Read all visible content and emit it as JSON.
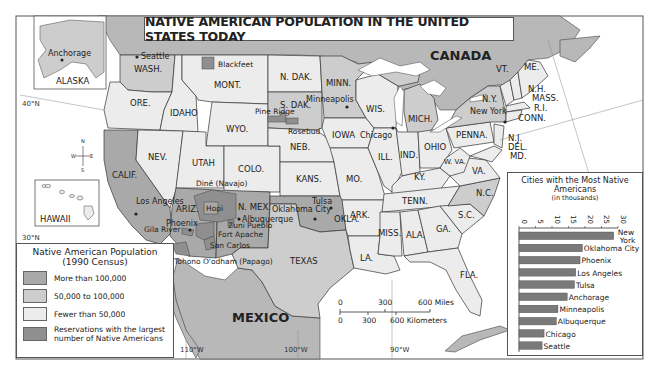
{
  "title": "NATIVE AMERICAN POPULATION IN THE UNITED STATES TODAY",
  "colors": {
    "more_than_100k": "#a9a9a9",
    "between_50k_100k": "#cdcdcd",
    "fewer_than_50k": "#ececec",
    "reservations": "#8f8f8f",
    "canada_mexico": "#b8b8b8",
    "water": "#ffffff",
    "border": "#333333"
  },
  "map_labels": {
    "canada": "CANADA",
    "mexico": "MEXICO",
    "alaska": "ALASKA",
    "hawaii": "HAWAII",
    "lat_40": "40°N",
    "lat_30": "30°N",
    "lon_110": "110°W",
    "lon_100": "100°W",
    "lon_90": "90°W",
    "compass": {
      "n": "N",
      "s": "S",
      "e": "E",
      "w": "W"
    }
  },
  "states": [
    {
      "abbr": "WASH.",
      "category": "50,000 to 100,000"
    },
    {
      "abbr": "ORE.",
      "category": "Fewer than 50,000"
    },
    {
      "abbr": "CALIF.",
      "category": "More than 100,000"
    },
    {
      "abbr": "IDAHO",
      "category": "Fewer than 50,000"
    },
    {
      "abbr": "NEV.",
      "category": "Fewer than 50,000"
    },
    {
      "abbr": "MONT.",
      "category": "Fewer than 50,000"
    },
    {
      "abbr": "WYO.",
      "category": "Fewer than 50,000"
    },
    {
      "abbr": "UTAH",
      "category": "Fewer than 50,000"
    },
    {
      "abbr": "COLO.",
      "category": "Fewer than 50,000"
    },
    {
      "abbr": "ARIZ.",
      "category": "More than 100,000"
    },
    {
      "abbr": "N. MEX.",
      "category": "More than 100,000"
    },
    {
      "abbr": "N. DAK.",
      "category": "Fewer than 50,000"
    },
    {
      "abbr": "S. DAK.",
      "category": "50,000 to 100,000"
    },
    {
      "abbr": "NEB.",
      "category": "Fewer than 50,000"
    },
    {
      "abbr": "KANS.",
      "category": "Fewer than 50,000"
    },
    {
      "abbr": "OKLA.",
      "category": "More than 100,000"
    },
    {
      "abbr": "TEXAS",
      "category": "50,000 to 100,000"
    },
    {
      "abbr": "MINN.",
      "category": "50,000 to 100,000"
    },
    {
      "abbr": "IOWA",
      "category": "Fewer than 50,000"
    },
    {
      "abbr": "MO.",
      "category": "Fewer than 50,000"
    },
    {
      "abbr": "ARK.",
      "category": "Fewer than 50,000"
    },
    {
      "abbr": "LA.",
      "category": "Fewer than 50,000"
    },
    {
      "abbr": "WIS.",
      "category": "Fewer than 50,000"
    },
    {
      "abbr": "ILL.",
      "category": "Fewer than 50,000"
    },
    {
      "abbr": "MICH.",
      "category": "50,000 to 100,000"
    },
    {
      "abbr": "IND.",
      "category": "Fewer than 50,000"
    },
    {
      "abbr": "OHIO",
      "category": "Fewer than 50,000"
    },
    {
      "abbr": "KY.",
      "category": "Fewer than 50,000"
    },
    {
      "abbr": "TENN.",
      "category": "Fewer than 50,000"
    },
    {
      "abbr": "MISS.",
      "category": "Fewer than 50,000"
    },
    {
      "abbr": "ALA.",
      "category": "Fewer than 50,000"
    },
    {
      "abbr": "GA.",
      "category": "Fewer than 50,000"
    },
    {
      "abbr": "FLA.",
      "category": "Fewer than 50,000"
    },
    {
      "abbr": "S.C.",
      "category": "Fewer than 50,000"
    },
    {
      "abbr": "N.C.",
      "category": "50,000 to 100,000"
    },
    {
      "abbr": "VA.",
      "category": "Fewer than 50,000"
    },
    {
      "abbr": "W. VA.",
      "category": "Fewer than 50,000"
    },
    {
      "abbr": "PENNA.",
      "category": "Fewer than 50,000"
    },
    {
      "abbr": "N.Y.",
      "category": "50,000 to 100,000"
    },
    {
      "abbr": "VT.",
      "category": "Fewer than 50,000"
    },
    {
      "abbr": "ME.",
      "category": "Fewer than 50,000"
    },
    {
      "abbr": "N.H.",
      "category": "Fewer than 50,000"
    },
    {
      "abbr": "MASS.",
      "category": "Fewer than 50,000"
    },
    {
      "abbr": "R.I.",
      "category": "Fewer than 50,000"
    },
    {
      "abbr": "CONN.",
      "category": "Fewer than 50,000"
    },
    {
      "abbr": "N.J.",
      "category": "Fewer than 50,000"
    },
    {
      "abbr": "DEL.",
      "category": "Fewer than 50,000"
    },
    {
      "abbr": "MD.",
      "category": "Fewer than 50,000"
    },
    {
      "abbr": "ALASKA",
      "category": "50,000 to 100,000"
    },
    {
      "abbr": "HAWAII",
      "category": "Fewer than 50,000"
    }
  ],
  "cities": [
    "Seattle",
    "Anchorage",
    "Los Angeles",
    "Phoenix",
    "Albuquerque",
    "Oklahoma City",
    "Tulsa",
    "Minneapolis",
    "Chicago",
    "New York"
  ],
  "reservations": [
    "Blackfeet",
    "Pine Ridge",
    "Rosebud",
    "Diné (Navajo)",
    "Hopi",
    "Zuni Pueblo",
    "Fort Apache",
    "San Carlos",
    "Gila River",
    "Tohono O'odham (Papago)"
  ],
  "legend": {
    "title_line1": "Native American Population",
    "title_line2": "(1990 Census)",
    "items": [
      {
        "label": "More than 100,000"
      },
      {
        "label": "50,000 to 100,000"
      },
      {
        "label": "Fewer than 50,000"
      },
      {
        "label": "Reservations with the largest number of Native Americans"
      }
    ]
  },
  "scale_bar": {
    "miles": [
      "0",
      "300",
      "600 Miles"
    ],
    "kilometers": [
      "0",
      "300",
      "600 Kilometers"
    ]
  },
  "chart_data": {
    "type": "bar",
    "orientation": "horizontal",
    "title": "Cities with the Most Native Americans",
    "subtitle": "(in thousands)",
    "categories": [
      "New York",
      "Oklahoma City",
      "Phoenix",
      "Los Angeles",
      "Tulsa",
      "Anchorage",
      "Minneapolis",
      "Albuquerque",
      "Chicago",
      "Seattle"
    ],
    "values": [
      28.7,
      19.2,
      18.5,
      17.2,
      16.8,
      14.6,
      11.8,
      11.3,
      7.6,
      7.0
    ],
    "xlabel": "",
    "ylabel": "",
    "xlim": [
      0,
      30
    ],
    "ticks": [
      "0",
      "5",
      "10",
      "15",
      "20",
      "25",
      "30"
    ],
    "tick_label_rotation": 90,
    "axis_position": "top",
    "grid": false,
    "bar_color": "#7a7a7a"
  }
}
